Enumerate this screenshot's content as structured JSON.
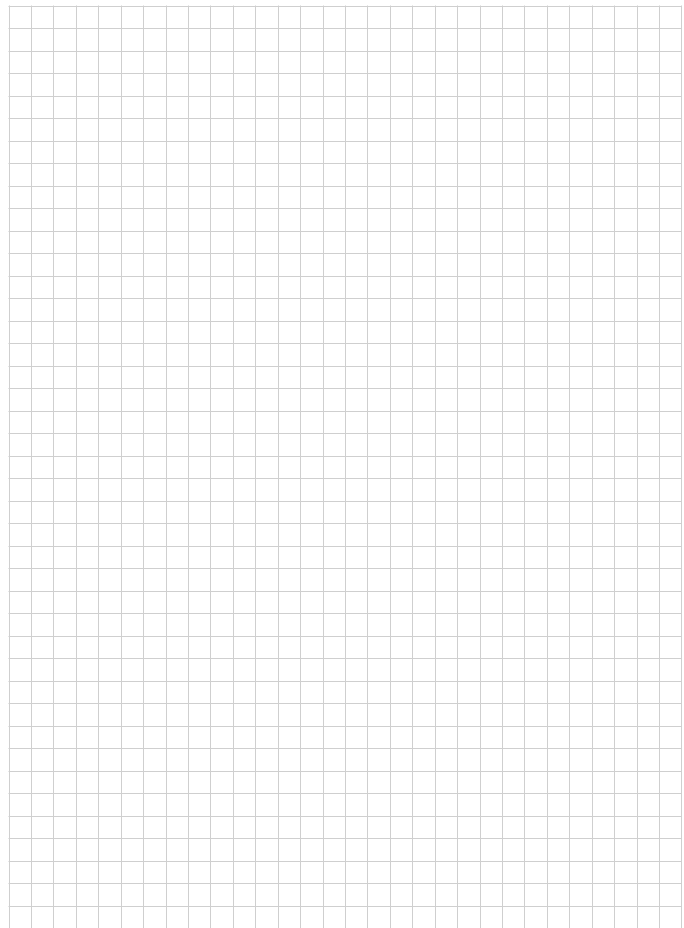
{
  "page": {
    "type": "graph-paper",
    "background_color": "#ffffff",
    "line_color": "#cfcfcf",
    "line_width": 1
  },
  "grid": {
    "origin_x": 8.5,
    "origin_y": 5.5,
    "cell_width": 22.43,
    "cell_height": 22.5,
    "columns": 30,
    "rows": 41,
    "extends_to_bottom_edge": true
  }
}
